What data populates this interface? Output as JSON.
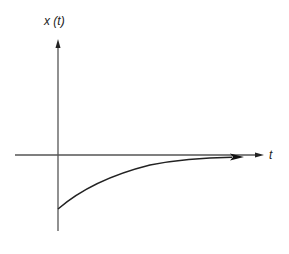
{
  "diagram": {
    "y_axis_label": "x (t)",
    "x_axis_label": "t",
    "colors": {
      "axis": "#555555",
      "curve": "#222222",
      "background": "#ffffff"
    },
    "curve": {
      "type": "exponential-decay-to-zero",
      "start": "negative value at t = 0",
      "asymptote": "x = 0"
    }
  }
}
